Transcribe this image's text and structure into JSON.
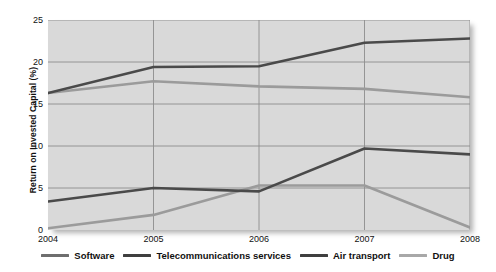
{
  "chart_data": {
    "type": "line",
    "title": "",
    "xlabel": "",
    "ylabel": "Return on Invested Capital (%)",
    "categories": [
      "2004",
      "2005",
      "2006",
      "2007",
      "2008"
    ],
    "x": [
      2004,
      2005,
      2006,
      2007,
      2008
    ],
    "ylim": [
      0,
      25
    ],
    "yticks": [
      0,
      5,
      10,
      15,
      20,
      25
    ],
    "grid": true,
    "legend_position": "bottom",
    "plot_background": "#d9d9d9",
    "series": [
      {
        "name": "Software",
        "color": "#9b9b9b",
        "values": [
          16.3,
          17.7,
          17.1,
          16.8,
          15.8
        ]
      },
      {
        "name": "Telecommunications services",
        "color": "#4a4a4a",
        "values": [
          16.3,
          19.4,
          19.5,
          22.3,
          22.8
        ]
      },
      {
        "name": "Air transport",
        "color": "#4a4a4a",
        "values": [
          3.4,
          5.0,
          4.6,
          9.7,
          9.0
        ]
      },
      {
        "name": "Drug",
        "color": "#9b9b9b",
        "values": [
          0.2,
          1.8,
          5.3,
          5.3,
          0.3
        ]
      }
    ]
  },
  "axis": {
    "ytick_labels": [
      "0",
      "5",
      "10",
      "15",
      "20",
      "25"
    ],
    "xtick_labels": [
      "2004",
      "2005",
      "2006",
      "2007",
      "2008"
    ],
    "ylabel": "Return on Invested Capital (%)"
  },
  "legend": {
    "items": [
      {
        "label": "Software",
        "color": "#6e6e6e"
      },
      {
        "label": "Telecommunications services",
        "color": "#3f3f3f"
      },
      {
        "label": "Air transport",
        "color": "#3f3f3f"
      },
      {
        "label": "Drug",
        "color": "#a8a8a8"
      }
    ]
  }
}
